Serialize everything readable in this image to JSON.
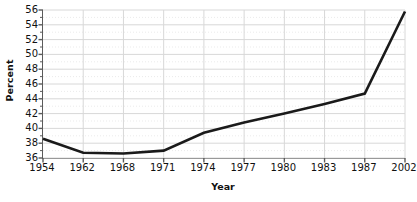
{
  "chart_data": {
    "type": "line",
    "title": "",
    "xlabel": "Year",
    "ylabel": "Percent",
    "categories": [
      "1954",
      "1962",
      "1968",
      "1971",
      "1974",
      "1977",
      "1980",
      "1983",
      "1987",
      "2002"
    ],
    "values": [
      38.6,
      36.7,
      36.6,
      37.0,
      39.4,
      40.8,
      42.0,
      43.3,
      44.7,
      55.8
    ],
    "series": [
      {
        "name": "Percent",
        "values": [
          38.6,
          36.7,
          36.6,
          37.0,
          39.4,
          40.8,
          42.0,
          43.3,
          44.7,
          55.8
        ]
      }
    ],
    "ylim": [
      36,
      56
    ],
    "ytick_values": [
      36,
      38,
      40,
      42,
      44,
      46,
      48,
      50,
      52,
      54,
      56
    ],
    "ytick_labels": [
      "36",
      "38",
      "40",
      "42",
      "44",
      "46",
      "48",
      "50",
      "52",
      "54",
      "56"
    ],
    "ytick_step": 2,
    "minor_gridlines": true,
    "grid": true,
    "legend": false,
    "legend_position": "none",
    "line_color": "#1a1a1a",
    "grid_color": "#d8d8d8",
    "minor_grid_color": "#ebebeb",
    "axis_color": "#5b5b5b",
    "background_color": "#ffffff",
    "line_width": 2.6
  }
}
